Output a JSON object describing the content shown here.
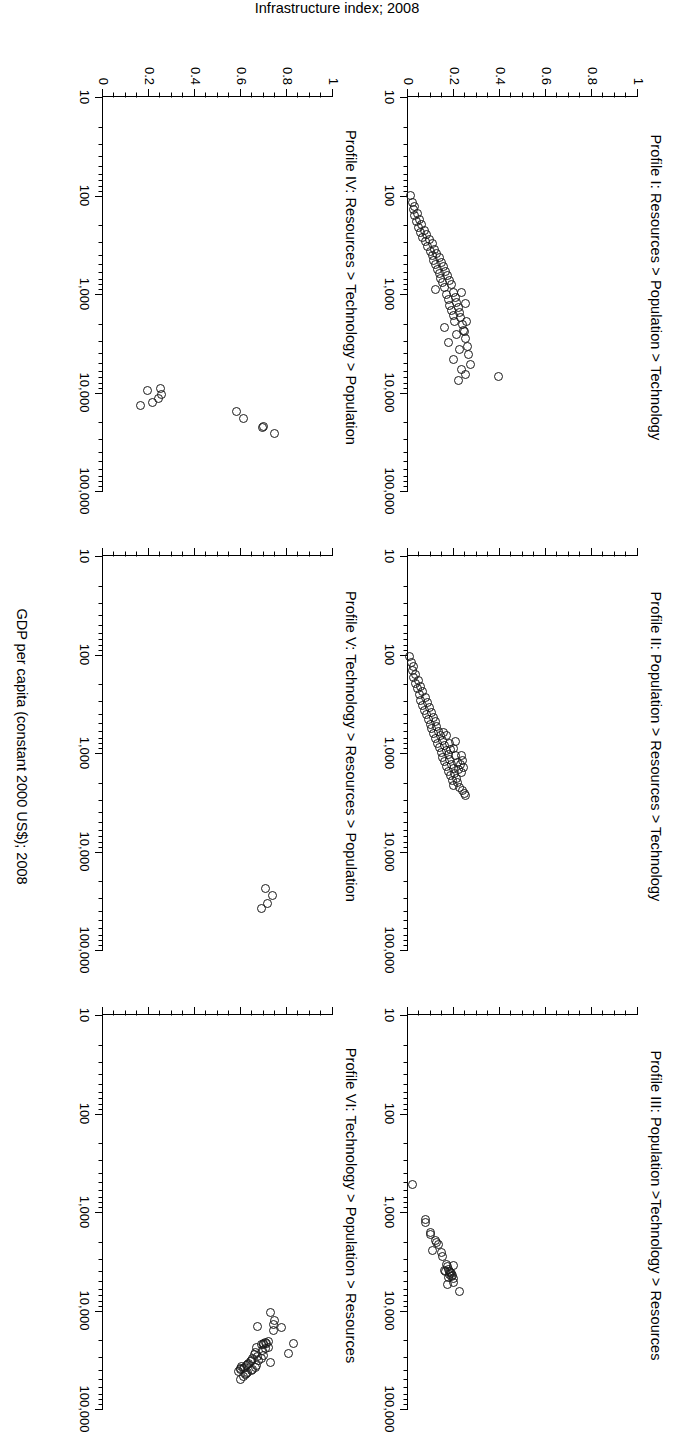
{
  "figure": {
    "axis_x_title": "GDP per capita (constant 2000 US$); 2008",
    "axis_y_title": "Infrastructure index; 2008"
  },
  "chart_data": {
    "type": "scatter",
    "title": "",
    "xlabel": "GDP per capita (constant 2000 US$); 2008",
    "ylabel": "Infrastructure index; 2008",
    "xscale": "log",
    "yscale": "linear",
    "xlim": [
      10,
      100000
    ],
    "ylim": [
      0,
      1
    ],
    "xticks": [
      10,
      100,
      1000,
      10000,
      100000
    ],
    "xticklabels": [
      "10",
      "100",
      "1,000",
      "10,000",
      "100,000"
    ],
    "yticks": [
      0,
      0.2,
      0.4,
      0.6,
      0.8,
      1
    ],
    "yticklabels": [
      "0",
      "0.2",
      "0.4",
      "0.6",
      "0.8",
      "1"
    ],
    "grid": false,
    "legend": null,
    "marker": "open-circle",
    "panels": [
      {
        "id": "profile-1",
        "title": "Profile I: Resources > Population > Technology",
        "row": 1,
        "col": 1,
        "points": [
          [
            100,
            0.01
          ],
          [
            118,
            0.018
          ],
          [
            130,
            0.03
          ],
          [
            140,
            0.022
          ],
          [
            152,
            0.04
          ],
          [
            160,
            0.028
          ],
          [
            175,
            0.052
          ],
          [
            185,
            0.038
          ],
          [
            195,
            0.06
          ],
          [
            210,
            0.046
          ],
          [
            225,
            0.07
          ],
          [
            238,
            0.055
          ],
          [
            250,
            0.082
          ],
          [
            265,
            0.063
          ],
          [
            280,
            0.092
          ],
          [
            295,
            0.075
          ],
          [
            310,
            0.105
          ],
          [
            330,
            0.085
          ],
          [
            350,
            0.115
          ],
          [
            370,
            0.097
          ],
          [
            390,
            0.125
          ],
          [
            410,
            0.105
          ],
          [
            430,
            0.135
          ],
          [
            455,
            0.112
          ],
          [
            480,
            0.145
          ],
          [
            505,
            0.12
          ],
          [
            530,
            0.155
          ],
          [
            560,
            0.128
          ],
          [
            590,
            0.162
          ],
          [
            620,
            0.136
          ],
          [
            650,
            0.172
          ],
          [
            690,
            0.142
          ],
          [
            730,
            0.18
          ],
          [
            770,
            0.15
          ],
          [
            810,
            0.19
          ],
          [
            860,
            0.158
          ],
          [
            900,
            0.12
          ],
          [
            960,
            0.2
          ],
          [
            1020,
            0.168
          ],
          [
            1080,
            0.205
          ],
          [
            1150,
            0.175
          ],
          [
            1220,
            0.212
          ],
          [
            1300,
            0.182
          ],
          [
            1380,
            0.218
          ],
          [
            1460,
            0.19
          ],
          [
            1550,
            0.224
          ],
          [
            1650,
            0.198
          ],
          [
            1750,
            0.23
          ],
          [
            1900,
            0.204
          ],
          [
            2050,
            0.238
          ],
          [
            2200,
            0.16
          ],
          [
            2400,
            0.245
          ],
          [
            2600,
            0.212
          ],
          [
            2800,
            0.252
          ],
          [
            3100,
            0.176
          ],
          [
            3400,
            0.258
          ],
          [
            3700,
            0.224
          ],
          [
            4100,
            0.265
          ],
          [
            4600,
            0.198
          ],
          [
            5200,
            0.272
          ],
          [
            5800,
            0.232
          ],
          [
            6600,
            0.248
          ],
          [
            7500,
            0.218
          ],
          [
            1900,
            0.255
          ],
          [
            2350,
            0.24
          ],
          [
            1250,
            0.248
          ],
          [
            960,
            0.232
          ],
          [
            6800,
            0.395
          ]
        ]
      },
      {
        "id": "profile-2",
        "title": "Profile II: Population > Resources > Technology",
        "row": 1,
        "col": 2,
        "points": [
          [
            105,
            0.006
          ],
          [
            120,
            0.014
          ],
          [
            132,
            0.024
          ],
          [
            145,
            0.018
          ],
          [
            158,
            0.034
          ],
          [
            170,
            0.026
          ],
          [
            182,
            0.044
          ],
          [
            196,
            0.032
          ],
          [
            210,
            0.054
          ],
          [
            224,
            0.04
          ],
          [
            240,
            0.064
          ],
          [
            256,
            0.048
          ],
          [
            272,
            0.074
          ],
          [
            290,
            0.056
          ],
          [
            308,
            0.084
          ],
          [
            326,
            0.064
          ],
          [
            346,
            0.094
          ],
          [
            366,
            0.072
          ],
          [
            388,
            0.102
          ],
          [
            410,
            0.08
          ],
          [
            434,
            0.11
          ],
          [
            458,
            0.088
          ],
          [
            484,
            0.118
          ],
          [
            512,
            0.096
          ],
          [
            540,
            0.126
          ],
          [
            570,
            0.104
          ],
          [
            602,
            0.134
          ],
          [
            636,
            0.112
          ],
          [
            672,
            0.142
          ],
          [
            710,
            0.12
          ],
          [
            750,
            0.15
          ],
          [
            792,
            0.128
          ],
          [
            836,
            0.158
          ],
          [
            884,
            0.136
          ],
          [
            934,
            0.166
          ],
          [
            986,
            0.144
          ],
          [
            1042,
            0.174
          ],
          [
            1100,
            0.152
          ],
          [
            1162,
            0.182
          ],
          [
            1228,
            0.16
          ],
          [
            1296,
            0.19
          ],
          [
            1370,
            0.168
          ],
          [
            1446,
            0.198
          ],
          [
            1528,
            0.176
          ],
          [
            1614,
            0.204
          ],
          [
            1704,
            0.184
          ],
          [
            1800,
            0.21
          ],
          [
            1900,
            0.192
          ],
          [
            2010,
            0.216
          ],
          [
            2120,
            0.2
          ],
          [
            2240,
            0.222
          ],
          [
            900,
            0.196
          ],
          [
            1050,
            0.208
          ],
          [
            1250,
            0.214
          ],
          [
            800,
            0.18
          ],
          [
            760,
            0.206
          ],
          [
            1060,
            0.232
          ],
          [
            1320,
            0.228
          ],
          [
            1560,
            0.234
          ],
          [
            2400,
            0.238
          ],
          [
            2600,
            0.244
          ],
          [
            2700,
            0.25
          ],
          [
            1400,
            0.24
          ],
          [
            1180,
            0.236
          ],
          [
            660,
            0.166
          ],
          [
            620,
            0.154
          ],
          [
            930,
            0.186
          ],
          [
            1480,
            0.22
          ]
        ]
      },
      {
        "id": "profile-3",
        "title": "Profile III: Population >Technology > Resources",
        "row": 1,
        "col": 3,
        "points": [
          [
            520,
            0.02
          ],
          [
            1180,
            0.074
          ],
          [
            1280,
            0.078
          ],
          [
            1600,
            0.096
          ],
          [
            1700,
            0.1
          ],
          [
            1950,
            0.118
          ],
          [
            2050,
            0.122
          ],
          [
            2150,
            0.132
          ],
          [
            2600,
            0.146
          ],
          [
            2800,
            0.152
          ],
          [
            3400,
            0.168
          ],
          [
            3600,
            0.172
          ],
          [
            3800,
            0.176
          ],
          [
            4000,
            0.18
          ],
          [
            4100,
            0.186
          ],
          [
            4200,
            0.19
          ],
          [
            4300,
            0.182
          ],
          [
            4400,
            0.192
          ],
          [
            4500,
            0.188
          ],
          [
            4600,
            0.178
          ],
          [
            4700,
            0.196
          ],
          [
            3900,
            0.16
          ],
          [
            4050,
            0.164
          ],
          [
            5200,
            0.2
          ],
          [
            3500,
            0.198
          ],
          [
            5400,
            0.172
          ],
          [
            6400,
            0.222
          ],
          [
            2450,
            0.108
          ]
        ]
      },
      {
        "id": "profile-4",
        "title": "Profile IV: Resources > Technology > Population",
        "row": 2,
        "col": 1,
        "points": [
          [
            26000,
            0.745
          ],
          [
            22000,
            0.7
          ],
          [
            22500,
            0.695
          ],
          [
            18500,
            0.61
          ],
          [
            15500,
            0.58
          ],
          [
            9200,
            0.25
          ],
          [
            10500,
            0.255
          ],
          [
            11500,
            0.24
          ],
          [
            12500,
            0.215
          ],
          [
            9600,
            0.195
          ],
          [
            13500,
            0.165
          ]
        ]
      },
      {
        "id": "profile-5",
        "title": "Profile V: Technology > Resources > Population",
        "row": 2,
        "col": 2,
        "points": [
          [
            24000,
            0.705
          ],
          [
            28000,
            0.735
          ],
          [
            34000,
            0.715
          ],
          [
            38000,
            0.69
          ]
        ]
      },
      {
        "id": "profile-6",
        "title": "Profile VI: Technology > Population > Resources",
        "row": 2,
        "col": 3,
        "points": [
          [
            21500,
            0.83
          ],
          [
            27500,
            0.805
          ],
          [
            15000,
            0.775
          ],
          [
            12500,
            0.745
          ],
          [
            13800,
            0.742
          ],
          [
            15800,
            0.74
          ],
          [
            10500,
            0.73
          ],
          [
            20500,
            0.72
          ],
          [
            21800,
            0.712
          ],
          [
            21200,
            0.706
          ],
          [
            22000,
            0.7
          ],
          [
            21600,
            0.696
          ],
          [
            22400,
            0.69
          ],
          [
            23500,
            0.718
          ],
          [
            24500,
            0.708
          ],
          [
            25500,
            0.694
          ],
          [
            14500,
            0.672
          ],
          [
            28500,
            0.7
          ],
          [
            30500,
            0.688
          ],
          [
            29500,
            0.672
          ],
          [
            33500,
            0.73
          ],
          [
            32500,
            0.678
          ],
          [
            24000,
            0.668
          ],
          [
            26500,
            0.662
          ],
          [
            28000,
            0.658
          ],
          [
            36000,
            0.666
          ],
          [
            37500,
            0.662
          ],
          [
            31000,
            0.65
          ],
          [
            32000,
            0.644
          ],
          [
            33000,
            0.64
          ],
          [
            40000,
            0.65
          ],
          [
            41000,
            0.646
          ],
          [
            34500,
            0.632
          ],
          [
            35500,
            0.628
          ],
          [
            36500,
            0.624
          ],
          [
            43000,
            0.63
          ],
          [
            44000,
            0.626
          ],
          [
            38000,
            0.616
          ],
          [
            39000,
            0.612
          ],
          [
            45000,
            0.618
          ],
          [
            46500,
            0.612
          ],
          [
            37000,
            0.604
          ],
          [
            38500,
            0.6
          ],
          [
            39500,
            0.598
          ],
          [
            50000,
            0.6
          ],
          [
            42000,
            0.59
          ]
        ]
      }
    ]
  }
}
